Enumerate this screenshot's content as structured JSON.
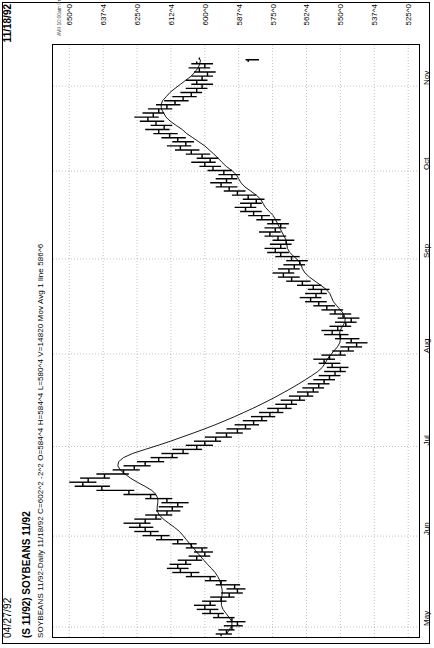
{
  "header": {
    "left_date": "04/27/92",
    "right_date": "11/18/92"
  },
  "title": "(S 11/92) SOYBEANS 11/92",
  "quote_line": "SOYBEANS 11/92-Daily 11/18/92 C=602^2 -2^2 O=584^4 H=584^4 L=580^4 V=14820 Mov Avg 1 line 586^6",
  "credit": "AVII 10:00am Printed using TradeStation © Omega Research, Inc. 1997",
  "symbol": "S 11/92",
  "instrument": "SOYBEANS 11/92",
  "interval": "Daily",
  "quote": {
    "date": "11/18/92",
    "close": "602^2",
    "change": "-2^2",
    "open": "584^4",
    "high": "584^4",
    "low": "580^4",
    "volume": "14820",
    "indicator_label": "Mov Avg 1 line",
    "indicator_value": "586^6"
  },
  "colors": {
    "background": "#ffffff",
    "ink": "#000000",
    "grid": "#aaaaaa",
    "ma_line": "#000000"
  },
  "chart_data": {
    "type": "bar",
    "chart_subtype": "ohlc-bar",
    "title": "(S 11/92) SOYBEANS 11/92",
    "xlabel": "",
    "ylabel": "",
    "orientation": "rotated-90ccw",
    "grid": true,
    "legend": "none",
    "xlim": [
      "1992-04-27",
      "1992-11-18"
    ],
    "ylim": [
      521,
      656
    ],
    "ytick_labels": [
      "650^0",
      "637^4",
      "625^0",
      "612^4",
      "600^0",
      "587^4",
      "575^0",
      "562^4",
      "550^0",
      "537^4",
      "525^0"
    ],
    "ytick_values": [
      650.0,
      637.5,
      625.0,
      612.5,
      600.0,
      587.5,
      575.0,
      562.5,
      550.0,
      537.5,
      525.0
    ],
    "xtick_labels": [
      "May",
      "Jun",
      "Jul",
      "Aug",
      "Sep",
      "Oct",
      "Nov"
    ],
    "xtick_positions": [
      0.012,
      0.167,
      0.32,
      0.478,
      0.64,
      0.79,
      0.935
    ],
    "series": [
      {
        "name": "Mov Avg 1 line",
        "type": "line",
        "last_value": 586.75
      }
    ],
    "ohlc": [
      {
        "t": 0.0,
        "o": 594,
        "h": 596,
        "l": 590,
        "c": 592
      },
      {
        "t": 0.007,
        "o": 592,
        "h": 595,
        "l": 589,
        "c": 590
      },
      {
        "t": 0.014,
        "o": 590,
        "h": 593,
        "l": 586,
        "c": 588
      },
      {
        "t": 0.021,
        "o": 588,
        "h": 592,
        "l": 585,
        "c": 590
      },
      {
        "t": 0.028,
        "o": 590,
        "h": 597,
        "l": 589,
        "c": 595
      },
      {
        "t": 0.035,
        "o": 595,
        "h": 601,
        "l": 593,
        "c": 598
      },
      {
        "t": 0.042,
        "o": 598,
        "h": 603,
        "l": 595,
        "c": 600
      },
      {
        "t": 0.049,
        "o": 600,
        "h": 604,
        "l": 596,
        "c": 598
      },
      {
        "t": 0.056,
        "o": 598,
        "h": 601,
        "l": 592,
        "c": 594
      },
      {
        "t": 0.063,
        "o": 594,
        "h": 598,
        "l": 589,
        "c": 591
      },
      {
        "t": 0.07,
        "o": 591,
        "h": 594,
        "l": 586,
        "c": 588
      },
      {
        "t": 0.077,
        "o": 588,
        "h": 592,
        "l": 585,
        "c": 589
      },
      {
        "t": 0.084,
        "o": 589,
        "h": 596,
        "l": 587,
        "c": 594
      },
      {
        "t": 0.091,
        "o": 594,
        "h": 600,
        "l": 592,
        "c": 598
      },
      {
        "t": 0.098,
        "o": 598,
        "h": 607,
        "l": 596,
        "c": 605
      },
      {
        "t": 0.105,
        "o": 605,
        "h": 612,
        "l": 602,
        "c": 609
      },
      {
        "t": 0.112,
        "o": 609,
        "h": 614,
        "l": 606,
        "c": 610
      },
      {
        "t": 0.119,
        "o": 610,
        "h": 613,
        "l": 605,
        "c": 607
      },
      {
        "t": 0.126,
        "o": 607,
        "h": 610,
        "l": 601,
        "c": 603
      },
      {
        "t": 0.133,
        "o": 603,
        "h": 606,
        "l": 598,
        "c": 600
      },
      {
        "t": 0.14,
        "o": 600,
        "h": 604,
        "l": 597,
        "c": 601
      },
      {
        "t": 0.147,
        "o": 601,
        "h": 607,
        "l": 599,
        "c": 605
      },
      {
        "t": 0.154,
        "o": 605,
        "h": 612,
        "l": 603,
        "c": 610
      },
      {
        "t": 0.161,
        "o": 610,
        "h": 618,
        "l": 608,
        "c": 616
      },
      {
        "t": 0.168,
        "o": 616,
        "h": 623,
        "l": 613,
        "c": 620
      },
      {
        "t": 0.175,
        "o": 620,
        "h": 626,
        "l": 617,
        "c": 622
      },
      {
        "t": 0.182,
        "o": 622,
        "h": 628,
        "l": 619,
        "c": 624
      },
      {
        "t": 0.189,
        "o": 624,
        "h": 630,
        "l": 620,
        "c": 622
      },
      {
        "t": 0.196,
        "o": 622,
        "h": 626,
        "l": 616,
        "c": 618
      },
      {
        "t": 0.203,
        "o": 618,
        "h": 622,
        "l": 612,
        "c": 614
      },
      {
        "t": 0.21,
        "o": 614,
        "h": 618,
        "l": 609,
        "c": 612
      },
      {
        "t": 0.217,
        "o": 612,
        "h": 617,
        "l": 608,
        "c": 610
      },
      {
        "t": 0.224,
        "o": 610,
        "h": 616,
        "l": 606,
        "c": 614
      },
      {
        "t": 0.231,
        "o": 614,
        "h": 622,
        "l": 612,
        "c": 620
      },
      {
        "t": 0.238,
        "o": 620,
        "h": 630,
        "l": 618,
        "c": 628
      },
      {
        "t": 0.245,
        "o": 628,
        "h": 640,
        "l": 626,
        "c": 638
      },
      {
        "t": 0.252,
        "o": 638,
        "h": 648,
        "l": 635,
        "c": 645
      },
      {
        "t": 0.259,
        "o": 645,
        "h": 650,
        "l": 640,
        "c": 643
      },
      {
        "t": 0.266,
        "o": 643,
        "h": 646,
        "l": 635,
        "c": 637
      },
      {
        "t": 0.273,
        "o": 637,
        "h": 640,
        "l": 628,
        "c": 630
      },
      {
        "t": 0.28,
        "o": 630,
        "h": 634,
        "l": 624,
        "c": 626
      },
      {
        "t": 0.287,
        "o": 626,
        "h": 630,
        "l": 620,
        "c": 622
      },
      {
        "t": 0.294,
        "o": 622,
        "h": 625,
        "l": 615,
        "c": 617
      },
      {
        "t": 0.301,
        "o": 617,
        "h": 620,
        "l": 610,
        "c": 612
      },
      {
        "t": 0.308,
        "o": 612,
        "h": 616,
        "l": 606,
        "c": 608
      },
      {
        "t": 0.315,
        "o": 608,
        "h": 612,
        "l": 601,
        "c": 603
      },
      {
        "t": 0.322,
        "o": 603,
        "h": 607,
        "l": 597,
        "c": 600
      },
      {
        "t": 0.329,
        "o": 600,
        "h": 604,
        "l": 594,
        "c": 596
      },
      {
        "t": 0.336,
        "o": 596,
        "h": 600,
        "l": 590,
        "c": 592
      },
      {
        "t": 0.343,
        "o": 592,
        "h": 596,
        "l": 586,
        "c": 588
      },
      {
        "t": 0.35,
        "o": 588,
        "h": 592,
        "l": 583,
        "c": 585
      },
      {
        "t": 0.357,
        "o": 585,
        "h": 589,
        "l": 580,
        "c": 582
      },
      {
        "t": 0.364,
        "o": 582,
        "h": 586,
        "l": 577,
        "c": 579
      },
      {
        "t": 0.371,
        "o": 579,
        "h": 583,
        "l": 574,
        "c": 576
      },
      {
        "t": 0.378,
        "o": 576,
        "h": 580,
        "l": 571,
        "c": 573
      },
      {
        "t": 0.385,
        "o": 573,
        "h": 577,
        "l": 568,
        "c": 570
      },
      {
        "t": 0.392,
        "o": 570,
        "h": 574,
        "l": 566,
        "c": 568
      },
      {
        "t": 0.399,
        "o": 568,
        "h": 572,
        "l": 563,
        "c": 565
      },
      {
        "t": 0.406,
        "o": 565,
        "h": 569,
        "l": 560,
        "c": 562
      },
      {
        "t": 0.413,
        "o": 562,
        "h": 566,
        "l": 558,
        "c": 560
      },
      {
        "t": 0.42,
        "o": 560,
        "h": 564,
        "l": 556,
        "c": 558
      },
      {
        "t": 0.427,
        "o": 558,
        "h": 562,
        "l": 554,
        "c": 556
      },
      {
        "t": 0.434,
        "o": 556,
        "h": 560,
        "l": 552,
        "c": 554
      },
      {
        "t": 0.441,
        "o": 554,
        "h": 558,
        "l": 550,
        "c": 552
      },
      {
        "t": 0.448,
        "o": 552,
        "h": 556,
        "l": 548,
        "c": 550
      },
      {
        "t": 0.455,
        "o": 550,
        "h": 555,
        "l": 547,
        "c": 553
      },
      {
        "t": 0.462,
        "o": 553,
        "h": 558,
        "l": 550,
        "c": 556
      },
      {
        "t": 0.469,
        "o": 556,
        "h": 560,
        "l": 552,
        "c": 554
      },
      {
        "t": 0.476,
        "o": 554,
        "h": 557,
        "l": 548,
        "c": 550
      },
      {
        "t": 0.483,
        "o": 550,
        "h": 553,
        "l": 545,
        "c": 547
      },
      {
        "t": 0.49,
        "o": 547,
        "h": 550,
        "l": 542,
        "c": 544
      },
      {
        "t": 0.497,
        "o": 544,
        "h": 548,
        "l": 540,
        "c": 546
      },
      {
        "t": 0.504,
        "o": 546,
        "h": 552,
        "l": 543,
        "c": 550
      },
      {
        "t": 0.511,
        "o": 550,
        "h": 556,
        "l": 547,
        "c": 553
      },
      {
        "t": 0.518,
        "o": 553,
        "h": 557,
        "l": 549,
        "c": 551
      },
      {
        "t": 0.525,
        "o": 551,
        "h": 554,
        "l": 546,
        "c": 548
      },
      {
        "t": 0.532,
        "o": 548,
        "h": 552,
        "l": 544,
        "c": 546
      },
      {
        "t": 0.539,
        "o": 546,
        "h": 551,
        "l": 543,
        "c": 549
      },
      {
        "t": 0.546,
        "o": 549,
        "h": 554,
        "l": 546,
        "c": 552
      },
      {
        "t": 0.553,
        "o": 552,
        "h": 557,
        "l": 549,
        "c": 555
      },
      {
        "t": 0.56,
        "o": 555,
        "h": 560,
        "l": 552,
        "c": 558
      },
      {
        "t": 0.567,
        "o": 558,
        "h": 563,
        "l": 555,
        "c": 561
      },
      {
        "t": 0.574,
        "o": 561,
        "h": 565,
        "l": 557,
        "c": 559
      },
      {
        "t": 0.581,
        "o": 559,
        "h": 563,
        "l": 555,
        "c": 557
      },
      {
        "t": 0.588,
        "o": 557,
        "h": 562,
        "l": 554,
        "c": 560
      },
      {
        "t": 0.595,
        "o": 560,
        "h": 566,
        "l": 557,
        "c": 564
      },
      {
        "t": 0.602,
        "o": 564,
        "h": 570,
        "l": 561,
        "c": 568
      },
      {
        "t": 0.609,
        "o": 568,
        "h": 573,
        "l": 565,
        "c": 571
      },
      {
        "t": 0.616,
        "o": 571,
        "h": 575,
        "l": 567,
        "c": 569
      },
      {
        "t": 0.623,
        "o": 569,
        "h": 573,
        "l": 565,
        "c": 567
      },
      {
        "t": 0.63,
        "o": 567,
        "h": 571,
        "l": 563,
        "c": 565
      },
      {
        "t": 0.637,
        "o": 565,
        "h": 570,
        "l": 562,
        "c": 568
      },
      {
        "t": 0.644,
        "o": 568,
        "h": 574,
        "l": 565,
        "c": 572
      },
      {
        "t": 0.651,
        "o": 572,
        "h": 577,
        "l": 569,
        "c": 574
      },
      {
        "t": 0.658,
        "o": 574,
        "h": 578,
        "l": 570,
        "c": 572
      },
      {
        "t": 0.665,
        "o": 572,
        "h": 576,
        "l": 568,
        "c": 570
      },
      {
        "t": 0.672,
        "o": 570,
        "h": 575,
        "l": 567,
        "c": 573
      },
      {
        "t": 0.679,
        "o": 573,
        "h": 578,
        "l": 570,
        "c": 576
      },
      {
        "t": 0.686,
        "o": 576,
        "h": 580,
        "l": 572,
        "c": 574
      },
      {
        "t": 0.693,
        "o": 574,
        "h": 578,
        "l": 570,
        "c": 572
      },
      {
        "t": 0.7,
        "o": 572,
        "h": 577,
        "l": 569,
        "c": 575
      },
      {
        "t": 0.707,
        "o": 575,
        "h": 581,
        "l": 572,
        "c": 579
      },
      {
        "t": 0.714,
        "o": 579,
        "h": 584,
        "l": 576,
        "c": 582
      },
      {
        "t": 0.721,
        "o": 582,
        "h": 587,
        "l": 579,
        "c": 585
      },
      {
        "t": 0.728,
        "o": 585,
        "h": 589,
        "l": 581,
        "c": 583
      },
      {
        "t": 0.735,
        "o": 583,
        "h": 587,
        "l": 579,
        "c": 581
      },
      {
        "t": 0.742,
        "o": 581,
        "h": 586,
        "l": 578,
        "c": 584
      },
      {
        "t": 0.749,
        "o": 584,
        "h": 590,
        "l": 581,
        "c": 588
      },
      {
        "t": 0.756,
        "o": 588,
        "h": 593,
        "l": 585,
        "c": 591
      },
      {
        "t": 0.763,
        "o": 591,
        "h": 596,
        "l": 588,
        "c": 594
      },
      {
        "t": 0.77,
        "o": 594,
        "h": 598,
        "l": 590,
        "c": 592
      },
      {
        "t": 0.777,
        "o": 592,
        "h": 596,
        "l": 588,
        "c": 590
      },
      {
        "t": 0.784,
        "o": 590,
        "h": 595,
        "l": 587,
        "c": 593
      },
      {
        "t": 0.791,
        "o": 593,
        "h": 599,
        "l": 590,
        "c": 597
      },
      {
        "t": 0.798,
        "o": 597,
        "h": 602,
        "l": 594,
        "c": 600
      },
      {
        "t": 0.805,
        "o": 600,
        "h": 605,
        "l": 596,
        "c": 598
      },
      {
        "t": 0.812,
        "o": 598,
        "h": 603,
        "l": 595,
        "c": 601
      },
      {
        "t": 0.819,
        "o": 601,
        "h": 607,
        "l": 598,
        "c": 605
      },
      {
        "t": 0.826,
        "o": 605,
        "h": 611,
        "l": 602,
        "c": 609
      },
      {
        "t": 0.833,
        "o": 609,
        "h": 614,
        "l": 605,
        "c": 607
      },
      {
        "t": 0.84,
        "o": 607,
        "h": 612,
        "l": 604,
        "c": 610
      },
      {
        "t": 0.847,
        "o": 610,
        "h": 616,
        "l": 607,
        "c": 613
      },
      {
        "t": 0.854,
        "o": 613,
        "h": 619,
        "l": 610,
        "c": 617
      },
      {
        "t": 0.861,
        "o": 617,
        "h": 622,
        "l": 613,
        "c": 615
      },
      {
        "t": 0.868,
        "o": 615,
        "h": 620,
        "l": 612,
        "c": 618
      },
      {
        "t": 0.875,
        "o": 618,
        "h": 624,
        "l": 615,
        "c": 621
      },
      {
        "t": 0.882,
        "o": 621,
        "h": 626,
        "l": 617,
        "c": 619
      },
      {
        "t": 0.889,
        "o": 619,
        "h": 623,
        "l": 615,
        "c": 617
      },
      {
        "t": 0.896,
        "o": 617,
        "h": 621,
        "l": 612,
        "c": 614
      },
      {
        "t": 0.903,
        "o": 614,
        "h": 618,
        "l": 609,
        "c": 611
      },
      {
        "t": 0.91,
        "o": 611,
        "h": 615,
        "l": 606,
        "c": 608
      },
      {
        "t": 0.917,
        "o": 608,
        "h": 612,
        "l": 603,
        "c": 605
      },
      {
        "t": 0.924,
        "o": 605,
        "h": 609,
        "l": 601,
        "c": 603
      },
      {
        "t": 0.931,
        "o": 603,
        "h": 607,
        "l": 599,
        "c": 601
      },
      {
        "t": 0.938,
        "o": 601,
        "h": 605,
        "l": 597,
        "c": 603
      },
      {
        "t": 0.945,
        "o": 603,
        "h": 607,
        "l": 599,
        "c": 601
      },
      {
        "t": 0.952,
        "o": 601,
        "h": 605,
        "l": 597,
        "c": 599
      },
      {
        "t": 0.959,
        "o": 599,
        "h": 604,
        "l": 596,
        "c": 602
      },
      {
        "t": 0.966,
        "o": 602,
        "h": 606,
        "l": 598,
        "c": 600
      },
      {
        "t": 0.973,
        "o": 600,
        "h": 605,
        "l": 597,
        "c": 603
      },
      {
        "t": 0.98,
        "o": 584,
        "h": 585,
        "l": 580,
        "c": 602
      }
    ]
  }
}
